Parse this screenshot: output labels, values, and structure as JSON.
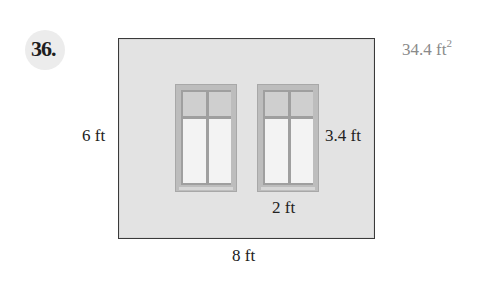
{
  "problem": {
    "number": "36.",
    "answer_value": "34.4 ft",
    "answer_exponent": "2"
  },
  "figure": {
    "wall": {
      "width_label": "8 ft",
      "height_label": "6 ft"
    },
    "windows": [
      {
        "id": "window-1"
      },
      {
        "id": "window-2"
      }
    ],
    "window_dimensions": {
      "width_label": "2 ft",
      "height_label": "3.4 ft"
    }
  },
  "colors": {
    "wall_fill": "#e3e3e3",
    "wall_border": "#3a3a3a",
    "window_frame": "#bdbdbd",
    "window_mullion": "#9f9f9f",
    "answer_text": "#8a8a8a"
  }
}
